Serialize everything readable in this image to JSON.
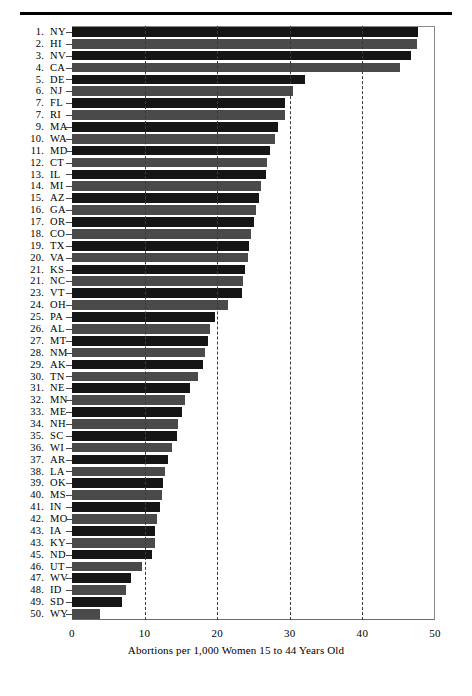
{
  "figure": {
    "top_rule": true
  },
  "chart_data": {
    "type": "bar",
    "orientation": "horizontal",
    "title": "",
    "xlabel": "Abortions per 1,000 Women 15 to 44 Years Old",
    "ylabel": "",
    "xlim": [
      0,
      50
    ],
    "xticks": [
      0,
      10,
      20,
      30,
      40,
      50
    ],
    "xtick_labels": [
      "0",
      "10",
      "20",
      "30",
      "40",
      "50"
    ],
    "grid": "vertical-dashed-at-10-20-30-40",
    "legend": "none",
    "categories": [
      "NY",
      "HI",
      "NV",
      "CA",
      "DE",
      "NJ",
      "FL",
      "RI",
      "MA",
      "WA",
      "MD",
      "CT",
      "IL",
      "MI",
      "AZ",
      "GA",
      "OR",
      "CO",
      "TX",
      "VA",
      "KS",
      "NC",
      "VT",
      "OH",
      "PA",
      "AL",
      "MT",
      "NM",
      "AK",
      "TN",
      "NE",
      "MN",
      "ME",
      "NH",
      "SC",
      "WI",
      "AR",
      "LA",
      "OK",
      "MS",
      "IN",
      "MO",
      "IA",
      "KY",
      "ND",
      "UT",
      "WV",
      "ID",
      "SD",
      "WY"
    ],
    "ranks": [
      "1.",
      "2.",
      "3.",
      "4.",
      "5.",
      "6.",
      "7.",
      "7.",
      "9.",
      "10.",
      "11.",
      "12.",
      "13.",
      "14.",
      "15.",
      "16.",
      "17.",
      "18.",
      "19.",
      "20.",
      "21.",
      "21.",
      "23.",
      "24.",
      "25.",
      "26.",
      "27.",
      "28.",
      "29.",
      "30.",
      "31.",
      "32.",
      "33.",
      "34.",
      "35.",
      "36.",
      "37.",
      "38.",
      "39.",
      "40.",
      "41.",
      "42.",
      "43.",
      "43.",
      "45.",
      "46.",
      "47.",
      "48.",
      "49.",
      "50."
    ],
    "values": [
      47.7,
      47.5,
      46.7,
      45.2,
      32.1,
      30.5,
      29.3,
      29.3,
      28.4,
      28.0,
      27.3,
      26.9,
      26.7,
      26.1,
      25.8,
      25.3,
      25.1,
      24.6,
      24.4,
      24.2,
      23.8,
      23.6,
      23.4,
      21.5,
      19.7,
      19.0,
      18.7,
      18.3,
      18.0,
      17.4,
      16.3,
      15.6,
      15.2,
      14.6,
      14.5,
      13.8,
      13.2,
      12.8,
      12.5,
      12.4,
      12.1,
      11.7,
      11.4,
      11.4,
      11.0,
      9.7,
      8.1,
      7.4,
      6.9,
      3.9
    ],
    "bar_shades": [
      "#151515",
      "#4a4a4a",
      "#151515",
      "#4a4a4a",
      "#151515",
      "#4a4a4a",
      "#151515",
      "#4a4a4a",
      "#151515",
      "#4a4a4a",
      "#151515",
      "#4a4a4a",
      "#151515",
      "#4a4a4a",
      "#151515",
      "#4a4a4a",
      "#151515",
      "#4a4a4a",
      "#151515",
      "#4a4a4a",
      "#151515",
      "#4a4a4a",
      "#151515",
      "#4a4a4a",
      "#151515",
      "#4a4a4a",
      "#151515",
      "#4a4a4a",
      "#151515",
      "#4a4a4a",
      "#151515",
      "#4a4a4a",
      "#151515",
      "#4a4a4a",
      "#151515",
      "#4a4a4a",
      "#151515",
      "#4a4a4a",
      "#151515",
      "#4a4a4a",
      "#151515",
      "#4a4a4a",
      "#151515",
      "#4a4a4a",
      "#151515",
      "#4a4a4a",
      "#151515",
      "#4a4a4a",
      "#151515",
      "#4a4a4a"
    ]
  },
  "caption": {
    "text_before": "Abortions per 1,000 Women 15 ",
    "to": "to",
    "text_after": " 44 Years Old",
    "full": "Abortions per 1,000 Women 15 to 44 Years Old"
  },
  "colors": {
    "dark_bar": "#151515",
    "light_bar": "#4a4a4a",
    "gridline": "#3a3a3a",
    "frame": "#8a8a8a",
    "text": "#000000"
  }
}
